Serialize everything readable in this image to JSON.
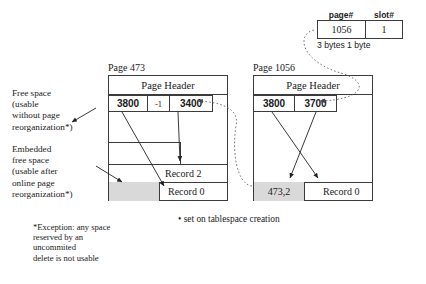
{
  "diagram": {
    "rid_table": {
      "headers": [
        "page#",
        "slot#"
      ],
      "values": [
        "1056",
        "1"
      ],
      "byte_note": "3 bytes 1 byte"
    },
    "pages": [
      {
        "caption": "Page  473",
        "header_label": "Page Header",
        "slots": [
          "3800",
          "-1",
          "3400"
        ],
        "records": [
          "Record  2",
          "Record  0"
        ],
        "has_embedded_free_space_block": true
      },
      {
        "caption": "Page  1056",
        "header_label": "Page Header",
        "slots": [
          "3800",
          "3700"
        ],
        "records": [
          "473,2",
          "Record  0"
        ],
        "has_embedded_free_space_block": true
      }
    ],
    "annotations": {
      "free_space": "Free space\n(usable\nwithout page\nreorganization*)",
      "embedded_free_space": "Embedded\nfree space\n(usable after\nonline page\nreorganization*)",
      "bullet_note": "• set on tablespace creation",
      "footnote": "*Exception: any space\nreserved by an\nuncommited\ndelete is not usable"
    },
    "colors": {
      "line": "#3b3b3b",
      "gray_fill": "#d9d9d9",
      "text": "#1a1a1a"
    }
  }
}
